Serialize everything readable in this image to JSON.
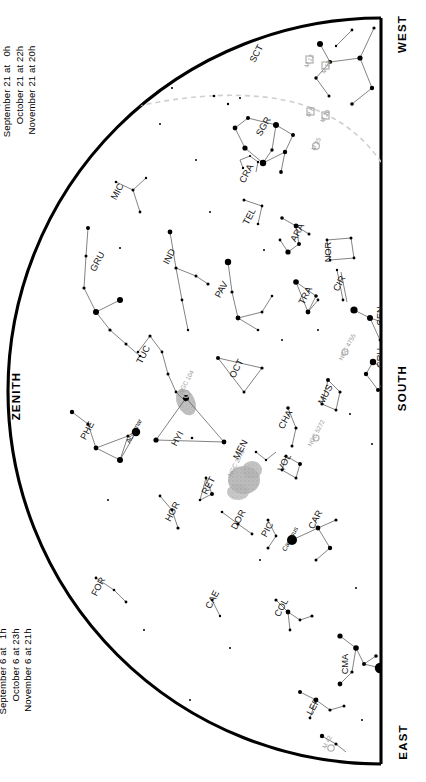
{
  "chart_data": {
    "type": "scatter",
    "projection": "half-dome (horizon arc left, meridian edge right)",
    "orientation": "rotated 90 degrees; labels read bottom-to-top",
    "grid": false,
    "legend": "none",
    "xlabel": "",
    "ylabel": "",
    "ecliptic_line": "dashed light-grey arc across upper region",
    "magnitude_scale": "dot radius proportional to brightness; largest dots = mag -1 to 0",
    "constellations": [
      {
        "abbr": "SCT",
        "x": 259,
        "y": 55,
        "rot": -62
      },
      {
        "abbr": "SCO",
        "x": 393,
        "y": 185,
        "rot": -90
      },
      {
        "abbr": "SGR",
        "x": 266,
        "y": 128,
        "rot": -60
      },
      {
        "abbr": "CRA",
        "x": 249,
        "y": 175,
        "rot": -62
      },
      {
        "abbr": "MIC",
        "x": 120,
        "y": 193,
        "rot": -62
      },
      {
        "abbr": "TEL",
        "x": 252,
        "y": 218,
        "rot": -62
      },
      {
        "abbr": "ARA",
        "x": 300,
        "y": 234,
        "rot": -62
      },
      {
        "abbr": "NOR",
        "x": 331,
        "y": 252,
        "rot": -90
      },
      {
        "abbr": "LUP",
        "x": 400,
        "y": 245,
        "rot": -62
      },
      {
        "abbr": "GRU",
        "x": 100,
        "y": 263,
        "rot": -62
      },
      {
        "abbr": "IND",
        "x": 172,
        "y": 258,
        "rot": -62
      },
      {
        "abbr": "PAV",
        "x": 224,
        "y": 291,
        "rot": -62
      },
      {
        "abbr": "TRA",
        "x": 308,
        "y": 297,
        "rot": -62
      },
      {
        "abbr": "CIR",
        "x": 342,
        "y": 285,
        "rot": -62
      },
      {
        "abbr": "CEN",
        "x": 383,
        "y": 316,
        "rot": -90
      },
      {
        "abbr": "TUC",
        "x": 146,
        "y": 356,
        "rot": -62
      },
      {
        "abbr": "OCT",
        "x": 239,
        "y": 370,
        "rot": -62
      },
      {
        "abbr": "CRU",
        "x": 383,
        "y": 358,
        "rot": -90
      },
      {
        "abbr": "MUS",
        "x": 328,
        "y": 396,
        "rot": -62
      },
      {
        "abbr": "PHE",
        "x": 90,
        "y": 432,
        "rot": -62
      },
      {
        "abbr": "HYI",
        "x": 180,
        "y": 440,
        "rot": -62
      },
      {
        "abbr": "MEN",
        "x": 243,
        "y": 451,
        "rot": -62
      },
      {
        "abbr": "CHA",
        "x": 288,
        "y": 421,
        "rot": -62
      },
      {
        "abbr": "VOL",
        "x": 287,
        "y": 464,
        "rot": -62
      },
      {
        "abbr": "RET",
        "x": 211,
        "y": 487,
        "rot": -62
      },
      {
        "abbr": "HOR",
        "x": 175,
        "y": 513,
        "rot": -62
      },
      {
        "abbr": "DOR",
        "x": 241,
        "y": 521,
        "rot": -62
      },
      {
        "abbr": "PIC",
        "x": 270,
        "y": 531,
        "rot": -62
      },
      {
        "abbr": "CAR",
        "x": 318,
        "y": 521,
        "rot": -62
      },
      {
        "abbr": "FOR",
        "x": 101,
        "y": 588,
        "rot": -62
      },
      {
        "abbr": "CAE",
        "x": 215,
        "y": 601,
        "rot": -62
      },
      {
        "abbr": "COL",
        "x": 284,
        "y": 609,
        "rot": -62
      },
      {
        "abbr": "CMA",
        "x": 348,
        "y": 664,
        "rot": -90
      },
      {
        "abbr": "LEP",
        "x": 316,
        "y": 708,
        "rot": -62
      }
    ],
    "named_stars": [
      {
        "name": "Achernar",
        "x": 136,
        "y": 432,
        "rot": -62
      },
      {
        "name": "Canopus",
        "x": 292,
        "y": 540,
        "rot": -62
      },
      {
        "name": "Sirius",
        "x": 391,
        "y": 667,
        "rot": -62
      },
      {
        "name": "Naos",
        "x": 387,
        "y": 552,
        "rot": -62
      }
    ],
    "deep_sky_objects": [
      {
        "name": "M 17",
        "x": 311,
        "y": 62,
        "rot": -62
      },
      {
        "name": "M 18",
        "x": 328,
        "y": 68,
        "rot": -62
      },
      {
        "name": "M 8",
        "x": 312,
        "y": 113,
        "rot": -62
      },
      {
        "name": "M 20",
        "x": 327,
        "y": 117,
        "rot": -62
      },
      {
        "name": "M 25",
        "x": 318,
        "y": 145,
        "rot": -62
      },
      {
        "name": "NGC 104",
        "x": 188,
        "y": 383,
        "rot": -62
      },
      {
        "name": "NGC 2070",
        "x": 238,
        "y": 464,
        "rot": -62
      },
      {
        "name": "NGC 4755",
        "x": 349,
        "y": 348,
        "rot": -62
      },
      {
        "name": "NGC 5272",
        "x": 318,
        "y": 434,
        "rot": -62
      },
      {
        "name": "M 42",
        "x": 329,
        "y": 743,
        "rot": -62
      }
    ],
    "nebulae_patches": [
      {
        "name": "Small Magellanic Cloud",
        "cx": 186,
        "cy": 402,
        "rx": 9,
        "ry": 14
      },
      {
        "name": "Large Magellanic Cloud",
        "cx": 245,
        "cy": 481,
        "rx": 16,
        "ry": 14
      }
    ]
  },
  "dates_top": {
    "rows": [
      "July 21 at   4h",
      "August 21 at   2h",
      "September 21 at   0h",
      "October 21 at 22h",
      "November 21 at 20h"
    ]
  },
  "dates_bottom": {
    "rows": [
      "July 6 at   5h",
      "August 6 at   3h",
      "September 6 at   1h",
      "October 6 at 23h",
      "November 6 at 21h"
    ]
  },
  "cardinals": {
    "west": "WEST",
    "south": "SOUTH",
    "east": "EAST",
    "zenith": "ZENITH"
  },
  "colors": {
    "star": "#000000",
    "line": "#555555",
    "horizon": "#000000",
    "ecliptic": "#c9c9c9",
    "dso": "#9a9a9a",
    "cloud": "#b3b3b3"
  }
}
